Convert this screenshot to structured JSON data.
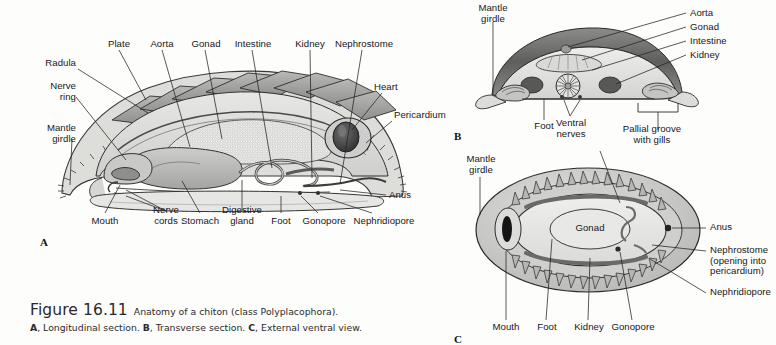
{
  "figure": {
    "number": "Figure 16.11",
    "title": "Anatomy of a chiton (class Polyplacophora).",
    "subcaption": "A, Longitudinal section. B, Transverse section. C, External ventral view."
  },
  "panels": {
    "a": {
      "letter": "A",
      "name": "Longitudinal section",
      "labels": {
        "radula": "Radula",
        "nerve_ring": "Nerve\nring",
        "mantle_girdle": "Mantle\ngirdle",
        "plate": "Plate",
        "aorta": "Aorta",
        "gonad": "Gonad",
        "intestine": "Intestine",
        "kidney": "Kidney",
        "nephrostome": "Nephrostome",
        "heart": "Heart",
        "pericardium": "Pericardium",
        "anus": "Anus",
        "mouth": "Mouth",
        "nerve_cords": "Nerve\ncords",
        "stomach": "Stomach",
        "digestive_gland": "Digestive\ngland",
        "foot": "Foot",
        "gonopore": "Gonopore",
        "nephridiopore": "Nephridiopore"
      }
    },
    "b": {
      "letter": "B",
      "name": "Transverse section",
      "labels": {
        "mantle_girdle": "Mantle\ngirdle",
        "aorta": "Aorta",
        "gonad": "Gonad",
        "intestine": "Intestine",
        "kidney": "Kidney",
        "foot": "Foot",
        "ventral_nerves": "Ventral\nnerves",
        "pallial_groove": "Pallial groove\nwith gills"
      }
    },
    "c": {
      "letter": "C",
      "name": "External ventral view",
      "labels": {
        "mantle_girdle": "Mantle\ngirdle",
        "gonad": "Gonad",
        "anus": "Anus",
        "nephrostome": "Nephrostome\n(opening into\npericardium)",
        "nephridiopore": "Nephridiopore",
        "mouth": "Mouth",
        "foot": "Foot",
        "kidney": "Kidney",
        "gonopore": "Gonopore"
      }
    }
  },
  "colors": {
    "ink": "#17171a",
    "leader": "#232323",
    "page": "#fdfdfc",
    "shell_dark": "#6f6f6f",
    "shell_mid": "#9a9a9a",
    "body_light": "#d9d9d7",
    "body_pale": "#ececea",
    "organ_mid": "#b4b4b2",
    "organ_dark": "#3f3f3f"
  }
}
